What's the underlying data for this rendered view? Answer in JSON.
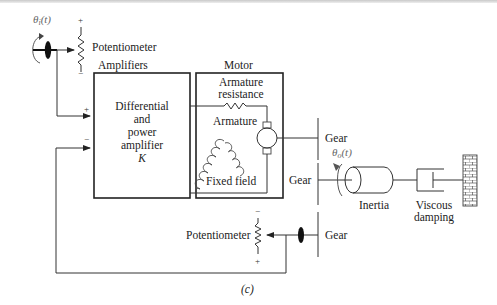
{
  "diagram": {
    "caption": "(c)",
    "input": {
      "angle_label": "θi(t)",
      "angle_symbol": "θ",
      "angle_sub": "i",
      "angle_arg": "(t)",
      "potentiometer_label": "Potentiometer",
      "pot_plus": "+",
      "pot_minus": "−"
    },
    "amplifier": {
      "header": "Amplifiers",
      "lines": [
        "Differential",
        "and",
        "power",
        "amplifier",
        "K"
      ],
      "input_plus": "+",
      "input_minus": "−"
    },
    "motor": {
      "header": "Motor",
      "armature_resistance": [
        "Armature",
        "resistance"
      ],
      "armature": "Armature",
      "fixed_field": "Fixed field"
    },
    "load": {
      "gear_upper": "Gear",
      "gear_middle": "Gear",
      "gear_lower": "Gear",
      "angle_symbol": "θ",
      "angle_sub": "o",
      "angle_arg": "(t)",
      "inertia": "Inertia",
      "viscous_damping": [
        "Viscous",
        "damping"
      ]
    },
    "feedback": {
      "potentiometer_label": "Potentiometer",
      "pot_minus": "−",
      "pot_plus": "+"
    }
  }
}
